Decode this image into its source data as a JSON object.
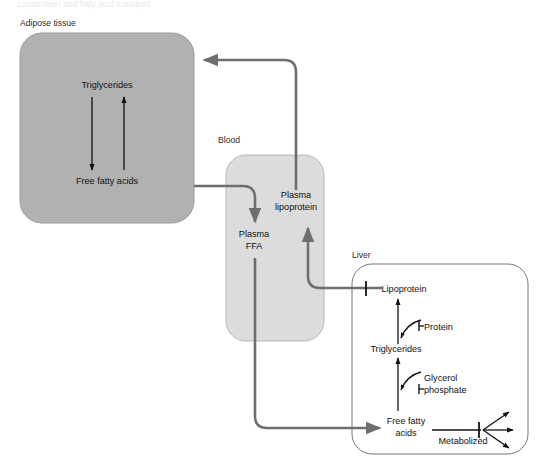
{
  "figure": {
    "title_cropped": "Lipoprotein and fatty acid transport",
    "background_color": "#ffffff"
  },
  "colors": {
    "adipose_fill": "#b1b1b1",
    "adipose_stroke": "#8f8f8f",
    "blood_fill": "#dcdcdc",
    "blood_stroke": "#b4b4b4",
    "liver_fill": "#ffffff",
    "liver_stroke": "#7a7a7a",
    "transport_arrow": "#6e6e6e",
    "internal_arrow": "#111111",
    "label_text": "#2b2b2b"
  },
  "compartments": [
    {
      "id": "adipose",
      "label": "Adipose tissue"
    },
    {
      "id": "blood",
      "label": "Blood"
    },
    {
      "id": "liver",
      "label": "Liver"
    }
  ],
  "adipose": {
    "label": "Adipose tissue",
    "nodes": [
      {
        "id": "adipose-triglycerides",
        "label": "Triglycerides"
      },
      {
        "id": "adipose-ffa",
        "label": "Free fatty acids"
      }
    ],
    "arrows": [
      {
        "id": "tg-to-ffa",
        "from": "Triglycerides",
        "to": "Free fatty acids",
        "direction": "down"
      },
      {
        "id": "ffa-to-tg",
        "from": "Free fatty acids",
        "to": "Triglycerides",
        "direction": "up"
      }
    ]
  },
  "blood": {
    "label": "Blood",
    "nodes": [
      {
        "id": "plasma-ffa",
        "label_line1": "Plasma",
        "label_line2": "FFA"
      },
      {
        "id": "plasma-lipoprotein",
        "label_line1": "Plasma",
        "label_line2": "lipoprotein"
      }
    ]
  },
  "liver": {
    "label": "Liver",
    "nodes": [
      {
        "id": "liver-lipoprotein",
        "label": "Lipoprotein"
      },
      {
        "id": "liver-protein",
        "label": "Protein"
      },
      {
        "id": "liver-triglycerides",
        "label": "Triglycerides"
      },
      {
        "id": "liver-glycerol-phosphate",
        "label_line1": "Glycerol",
        "label_line2": "phosphate"
      },
      {
        "id": "liver-ffa",
        "label_line1": "Free fatty",
        "label_line2": "acids"
      },
      {
        "id": "liver-metabolized",
        "label": "Metabolized"
      }
    ],
    "arrows": [
      {
        "id": "ffa-to-tg-liver",
        "from": "Free fatty acids",
        "to": "Triglycerides",
        "direction": "up"
      },
      {
        "id": "tg-to-lipoprotein-liver",
        "from": "Triglycerides",
        "to": "Lipoprotein",
        "direction": "up"
      },
      {
        "id": "glycerol-phosphate-in",
        "from": "Glycerol phosphate",
        "to": "Triglycerides pathway",
        "direction": "curve-left"
      },
      {
        "id": "protein-in",
        "from": "Protein",
        "to": "Lipoprotein pathway",
        "direction": "curve-left"
      },
      {
        "id": "metabolized-fan",
        "from": "Free fatty acids",
        "to": "Metabolized",
        "direction": "right-fan"
      }
    ]
  },
  "transport": [
    {
      "id": "plasma-lipoprotein-to-adipose",
      "from": "Plasma lipoprotein",
      "to": "Adipose tissue",
      "direction": "up-then-left"
    },
    {
      "id": "adipose-ffa-to-plasma-ffa",
      "from": "Adipose tissue",
      "to": "Plasma FFA",
      "direction": "right-then-down"
    },
    {
      "id": "plasma-ffa-to-liver-ffa",
      "from": "Plasma FFA",
      "to": "Liver Free fatty acids",
      "direction": "down-then-right"
    },
    {
      "id": "liver-lipoprotein-to-plasma-lipoprotein",
      "from": "Liver Lipoprotein",
      "to": "Plasma lipoprotein",
      "direction": "left-then-up"
    }
  ]
}
